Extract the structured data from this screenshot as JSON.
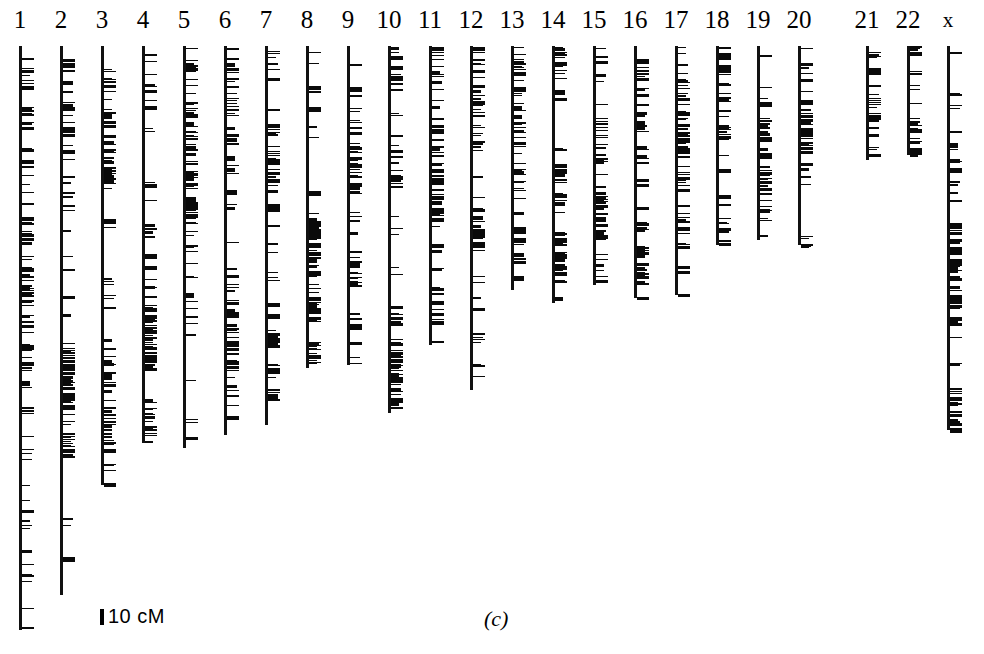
{
  "figure": {
    "panel_label": "(c)",
    "scalebar": {
      "label": "10 cM",
      "units": "cM",
      "value": 10
    },
    "background_color": "#ffffff",
    "ink_color": "#0a0a0a"
  },
  "chart_data": {
    "type": "bar",
    "title": "",
    "subtitle": "",
    "xlabel": "",
    "ylabel": "",
    "scale_cm_per_pixel": 0.9,
    "axis_top_y": 46,
    "categories": [
      "1",
      "2",
      "3",
      "4",
      "5",
      "6",
      "7",
      "8",
      "9",
      "10",
      "11",
      "12",
      "13",
      "14",
      "15",
      "16",
      "17",
      "18",
      "19",
      "20",
      "21",
      "22",
      "x"
    ],
    "values": [
      584,
      549,
      439,
      397,
      402,
      389,
      379,
      322,
      319,
      367,
      299,
      344,
      244,
      257,
      239,
      252,
      249,
      199,
      194,
      199,
      114,
      109,
      384
    ],
    "ylim": [
      0,
      600
    ],
    "legend": [],
    "grid": false,
    "chromosomes": [
      {
        "name": "1",
        "label": "1",
        "axis_x": 19,
        "top_y": 46,
        "bottom_y": 630,
        "length_px": 584,
        "marker_count": 118,
        "seed": 101
      },
      {
        "name": "2",
        "label": "2",
        "axis_x": 60,
        "top_y": 46,
        "bottom_y": 595,
        "length_px": 549,
        "marker_count": 112,
        "seed": 202
      },
      {
        "name": "3",
        "label": "3",
        "axis_x": 101,
        "top_y": 46,
        "bottom_y": 485,
        "length_px": 439,
        "marker_count": 96,
        "seed": 303
      },
      {
        "name": "4",
        "label": "4",
        "axis_x": 142,
        "top_y": 46,
        "bottom_y": 443,
        "length_px": 397,
        "marker_count": 88,
        "seed": 404
      },
      {
        "name": "5",
        "label": "5",
        "axis_x": 183,
        "top_y": 46,
        "bottom_y": 448,
        "length_px": 402,
        "marker_count": 90,
        "seed": 505
      },
      {
        "name": "6",
        "label": "6",
        "axis_x": 224,
        "top_y": 46,
        "bottom_y": 435,
        "length_px": 389,
        "marker_count": 86,
        "seed": 606
      },
      {
        "name": "7",
        "label": "7",
        "axis_x": 265,
        "top_y": 46,
        "bottom_y": 425,
        "length_px": 379,
        "marker_count": 84,
        "seed": 707
      },
      {
        "name": "8",
        "label": "8",
        "axis_x": 306,
        "top_y": 46,
        "bottom_y": 368,
        "length_px": 322,
        "marker_count": 74,
        "seed": 808
      },
      {
        "name": "9",
        "label": "9",
        "axis_x": 347,
        "top_y": 46,
        "bottom_y": 365,
        "length_px": 319,
        "marker_count": 72,
        "seed": 909
      },
      {
        "name": "10",
        "label": "10",
        "axis_x": 388,
        "top_y": 46,
        "bottom_y": 413,
        "length_px": 367,
        "marker_count": 80,
        "seed": 1010
      },
      {
        "name": "11",
        "label": "11",
        "axis_x": 429,
        "top_y": 46,
        "bottom_y": 345,
        "length_px": 299,
        "marker_count": 70,
        "seed": 1111
      },
      {
        "name": "12",
        "label": "12",
        "axis_x": 470,
        "top_y": 46,
        "bottom_y": 390,
        "length_px": 344,
        "marker_count": 76,
        "seed": 1212
      },
      {
        "name": "13",
        "label": "13",
        "axis_x": 511,
        "top_y": 46,
        "bottom_y": 290,
        "length_px": 244,
        "marker_count": 58,
        "seed": 1313
      },
      {
        "name": "14",
        "label": "14",
        "axis_x": 552,
        "top_y": 46,
        "bottom_y": 303,
        "length_px": 257,
        "marker_count": 62,
        "seed": 1414
      },
      {
        "name": "15",
        "label": "15",
        "axis_x": 593,
        "top_y": 46,
        "bottom_y": 285,
        "length_px": 239,
        "marker_count": 60,
        "seed": 1515
      },
      {
        "name": "16",
        "label": "16",
        "axis_x": 634,
        "top_y": 46,
        "bottom_y": 298,
        "length_px": 252,
        "marker_count": 62,
        "seed": 1616
      },
      {
        "name": "17",
        "label": "17",
        "axis_x": 675,
        "top_y": 46,
        "bottom_y": 295,
        "length_px": 249,
        "marker_count": 60,
        "seed": 1717
      },
      {
        "name": "18",
        "label": "18",
        "axis_x": 716,
        "top_y": 46,
        "bottom_y": 245,
        "length_px": 199,
        "marker_count": 50,
        "seed": 1818
      },
      {
        "name": "19",
        "label": "19",
        "axis_x": 757,
        "top_y": 46,
        "bottom_y": 240,
        "length_px": 194,
        "marker_count": 46,
        "seed": 1919
      },
      {
        "name": "20",
        "label": "20",
        "axis_x": 798,
        "top_y": 46,
        "bottom_y": 245,
        "length_px": 199,
        "marker_count": 52,
        "seed": 2020
      },
      {
        "name": "21",
        "label": "21",
        "axis_x": 866,
        "top_y": 46,
        "bottom_y": 160,
        "length_px": 114,
        "marker_count": 32,
        "seed": 2121
      },
      {
        "name": "22",
        "label": "22",
        "axis_x": 907,
        "top_y": 46,
        "bottom_y": 155,
        "length_px": 109,
        "marker_count": 30,
        "seed": 2222
      },
      {
        "name": "x",
        "label": "x",
        "axis_x": 947,
        "top_y": 46,
        "bottom_y": 430,
        "length_px": 384,
        "marker_count": 86,
        "seed": 2323
      }
    ]
  },
  "layout": {
    "scalebar_x": 100,
    "scalebar_y": 605,
    "panel_label_x": 484,
    "panel_label_y": 606,
    "tick_length": 12,
    "label_offset_x": -16
  }
}
